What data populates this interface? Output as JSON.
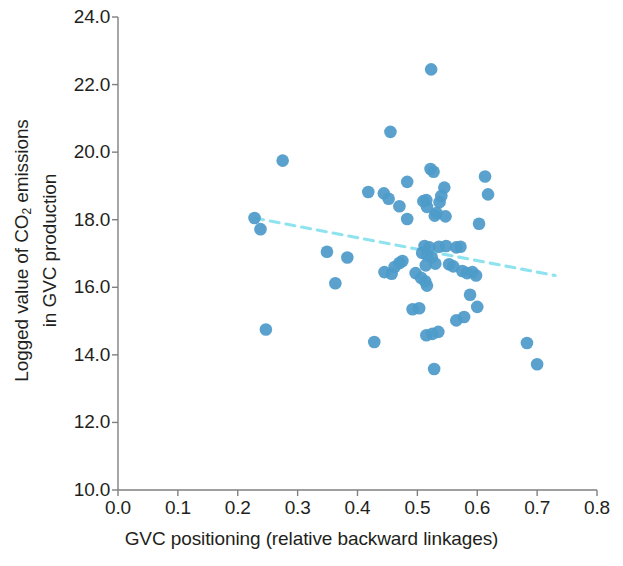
{
  "chart_data": {
    "type": "scatter",
    "title": "",
    "xlabel": "GVC positioning (relative backward linkages)",
    "ylabel_line1": "Logged value of CO",
    "ylabel_sub": "2",
    "ylabel_line1_rest": " emissions",
    "ylabel_line2": "in GVC production",
    "xlim": [
      0.0,
      0.8
    ],
    "ylim": [
      10.0,
      24.0
    ],
    "xticks": [
      "0.0",
      "0.1",
      "0.2",
      "0.3",
      "0.4",
      "0.5",
      "0.6",
      "0.7",
      "0.8"
    ],
    "xtick_values": [
      0.0,
      0.1,
      0.2,
      0.3,
      0.4,
      0.5,
      0.6,
      0.7,
      0.8
    ],
    "yticks": [
      "10.0",
      "12.0",
      "14.0",
      "16.0",
      "18.0",
      "20.0",
      "22.0",
      "24.0"
    ],
    "ytick_values": [
      10.0,
      12.0,
      14.0,
      16.0,
      18.0,
      20.0,
      22.0,
      24.0
    ],
    "grid": false,
    "legend": false,
    "marker_color": "#4e9bc9",
    "marker_size": 9,
    "trendline": {
      "style": "dashed",
      "color": "#8fe3ef",
      "x_start": 0.228,
      "y_start": 18.05,
      "x_end": 0.73,
      "y_end": 16.35
    },
    "points": [
      {
        "x": 0.523,
        "y": 22.45
      },
      {
        "x": 0.455,
        "y": 20.6
      },
      {
        "x": 0.275,
        "y": 19.75
      },
      {
        "x": 0.522,
        "y": 19.5
      },
      {
        "x": 0.527,
        "y": 19.42
      },
      {
        "x": 0.613,
        "y": 19.28
      },
      {
        "x": 0.483,
        "y": 19.12
      },
      {
        "x": 0.545,
        "y": 18.95
      },
      {
        "x": 0.618,
        "y": 18.75
      },
      {
        "x": 0.418,
        "y": 18.82
      },
      {
        "x": 0.444,
        "y": 18.78
      },
      {
        "x": 0.452,
        "y": 18.62
      },
      {
        "x": 0.54,
        "y": 18.7
      },
      {
        "x": 0.515,
        "y": 18.58
      },
      {
        "x": 0.51,
        "y": 18.55
      },
      {
        "x": 0.537,
        "y": 18.52
      },
      {
        "x": 0.47,
        "y": 18.4
      },
      {
        "x": 0.516,
        "y": 18.38
      },
      {
        "x": 0.532,
        "y": 18.2
      },
      {
        "x": 0.529,
        "y": 18.12
      },
      {
        "x": 0.547,
        "y": 18.1
      },
      {
        "x": 0.483,
        "y": 18.02
      },
      {
        "x": 0.603,
        "y": 17.88
      },
      {
        "x": 0.228,
        "y": 18.05
      },
      {
        "x": 0.238,
        "y": 17.72
      },
      {
        "x": 0.349,
        "y": 17.05
      },
      {
        "x": 0.383,
        "y": 16.88
      },
      {
        "x": 0.475,
        "y": 16.78
      },
      {
        "x": 0.47,
        "y": 16.72
      },
      {
        "x": 0.512,
        "y": 17.22
      },
      {
        "x": 0.52,
        "y": 17.18
      },
      {
        "x": 0.536,
        "y": 17.2
      },
      {
        "x": 0.548,
        "y": 17.22
      },
      {
        "x": 0.565,
        "y": 17.18
      },
      {
        "x": 0.572,
        "y": 17.2
      },
      {
        "x": 0.508,
        "y": 17.02
      },
      {
        "x": 0.516,
        "y": 16.95
      },
      {
        "x": 0.524,
        "y": 16.88
      },
      {
        "x": 0.53,
        "y": 16.7
      },
      {
        "x": 0.514,
        "y": 16.65
      },
      {
        "x": 0.553,
        "y": 16.68
      },
      {
        "x": 0.56,
        "y": 16.62
      },
      {
        "x": 0.462,
        "y": 16.6
      },
      {
        "x": 0.575,
        "y": 16.48
      },
      {
        "x": 0.583,
        "y": 16.42
      },
      {
        "x": 0.592,
        "y": 16.45
      },
      {
        "x": 0.598,
        "y": 16.35
      },
      {
        "x": 0.497,
        "y": 16.42
      },
      {
        "x": 0.457,
        "y": 16.4
      },
      {
        "x": 0.445,
        "y": 16.45
      },
      {
        "x": 0.363,
        "y": 16.12
      },
      {
        "x": 0.506,
        "y": 16.28
      },
      {
        "x": 0.513,
        "y": 16.18
      },
      {
        "x": 0.516,
        "y": 16.05
      },
      {
        "x": 0.588,
        "y": 15.78
      },
      {
        "x": 0.6,
        "y": 15.42
      },
      {
        "x": 0.492,
        "y": 15.35
      },
      {
        "x": 0.503,
        "y": 15.38
      },
      {
        "x": 0.578,
        "y": 15.12
      },
      {
        "x": 0.428,
        "y": 14.38
      },
      {
        "x": 0.247,
        "y": 14.75
      },
      {
        "x": 0.515,
        "y": 14.58
      },
      {
        "x": 0.525,
        "y": 14.62
      },
      {
        "x": 0.535,
        "y": 14.68
      },
      {
        "x": 0.565,
        "y": 15.02
      },
      {
        "x": 0.683,
        "y": 14.35
      },
      {
        "x": 0.7,
        "y": 13.72
      },
      {
        "x": 0.528,
        "y": 13.58
      }
    ]
  },
  "axes": {
    "axis_color": "#808080",
    "text_color": "#231f20"
  }
}
